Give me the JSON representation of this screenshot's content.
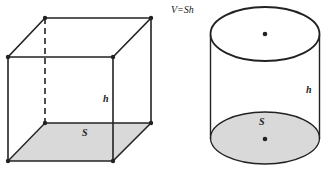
{
  "figure": {
    "formula": "V=Sh",
    "prism": {
      "height_label": "h",
      "base_label": "S"
    },
    "cylinder": {
      "height_label": "h",
      "base_label": "S"
    }
  },
  "colors": {
    "stroke": "#222222",
    "base_fill": "#d9d9d9",
    "background": "#ffffff"
  }
}
